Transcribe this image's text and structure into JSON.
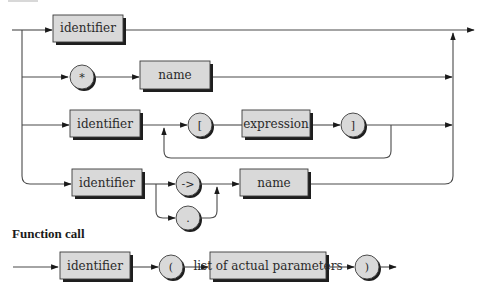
{
  "diagram": {
    "type": "syntax-railroad",
    "top_rows": [
      {
        "row": 1,
        "elements": [
          {
            "kind": "terminal-box",
            "label": "identifier"
          }
        ]
      },
      {
        "row": 2,
        "elements": [
          {
            "kind": "token-circle",
            "label": "*"
          },
          {
            "kind": "terminal-box",
            "label": "name"
          }
        ]
      },
      {
        "row": 3,
        "elements": [
          {
            "kind": "terminal-box",
            "label": "identifier"
          },
          {
            "kind": "token-circle",
            "label": "["
          },
          {
            "kind": "terminal-box",
            "label": "expression"
          },
          {
            "kind": "token-circle",
            "label": "]"
          }
        ],
        "loop": "repeat [ expression ]"
      },
      {
        "row": 4,
        "elements": [
          {
            "kind": "terminal-box",
            "label": "identifier"
          },
          {
            "kind": "token-circle",
            "label": "->",
            "alt": "."
          },
          {
            "kind": "terminal-box",
            "label": "name"
          }
        ]
      }
    ],
    "labels": {
      "r1_identifier": "identifier",
      "r2_star": "*",
      "r2_name": "name",
      "r3_identifier": "identifier",
      "r3_lbracket": "[",
      "r3_expression": "expression",
      "r3_rbracket": "]",
      "r4_identifier": "identifier",
      "r4_arrow": "->",
      "r4_dot": ".",
      "r4_name": "name"
    },
    "function_call": {
      "heading": "Function call",
      "identifier": "identifier",
      "lparen": "(",
      "params": "list of actual parameters",
      "rparen": ")"
    }
  }
}
